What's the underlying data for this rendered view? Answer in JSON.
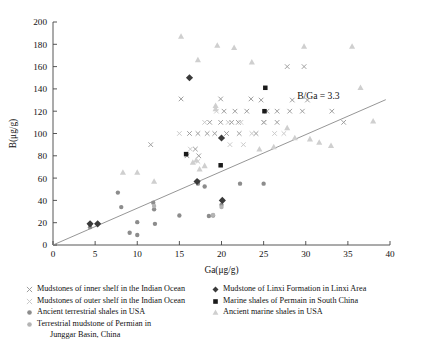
{
  "chart_data": {
    "type": "scatter",
    "title": "",
    "xlabel": "Ga(μg/g)",
    "ylabel": "B(μg/g)",
    "xlim": [
      0,
      40
    ],
    "ylim": [
      0,
      200
    ],
    "xticks": [
      0,
      5,
      10,
      15,
      20,
      25,
      30,
      35,
      40
    ],
    "yticks": [
      0,
      20,
      40,
      60,
      80,
      100,
      120,
      140,
      160,
      180,
      200
    ],
    "grid": false,
    "legend_position": "below-axes",
    "annotations": [
      {
        "text": "B/Ga = 3.3",
        "x": 31.5,
        "y": 131,
        "name": "ratio-line-label"
      }
    ],
    "reference_line": {
      "name": "b-ga-ratio-line",
      "label": "B/Ga = 3.3",
      "slope": 3.3,
      "intercept": 0,
      "x_from": 0,
      "x_to": 39.5,
      "color": "#8a8a8a"
    },
    "series": [
      {
        "name": "Mudstones of inner shelf in the Indian Ocean",
        "marker": "x",
        "color": "#9a9a9a",
        "points": [
          [
            11.6,
            90
          ],
          [
            15.2,
            131
          ],
          [
            16.9,
            86
          ],
          [
            15.9,
            80
          ],
          [
            17.3,
            80
          ],
          [
            19.9,
            131
          ],
          [
            22.0,
            110
          ],
          [
            22.1,
            100
          ],
          [
            23.5,
            131
          ],
          [
            24.7,
            130
          ],
          [
            20.3,
            120
          ],
          [
            21.6,
            120
          ],
          [
            23.0,
            120
          ],
          [
            25.4,
            120
          ],
          [
            26.6,
            120
          ],
          [
            18.6,
            110
          ],
          [
            19.9,
            110
          ],
          [
            21.2,
            110
          ],
          [
            19.2,
            100
          ],
          [
            20.6,
            100
          ],
          [
            18.3,
            100
          ],
          [
            17.2,
            100
          ],
          [
            16.2,
            100
          ],
          [
            27.8,
            160
          ],
          [
            29.8,
            160
          ],
          [
            28.4,
            130
          ],
          [
            30.2,
            130
          ],
          [
            28.1,
            120
          ],
          [
            29.6,
            120
          ],
          [
            33.1,
            120
          ],
          [
            34.5,
            110
          ],
          [
            26.6,
            110
          ],
          [
            25.0,
            110
          ],
          [
            24.1,
            100
          ]
        ]
      },
      {
        "name": "Mudstones of outer shelf in the Indian Ocean",
        "marker": "x-light",
        "color": "#c8c8c8",
        "points": [
          [
            15.0,
            100
          ],
          [
            16.3,
            86
          ],
          [
            17.2,
            75
          ],
          [
            18.0,
            110
          ],
          [
            19.4,
            120
          ],
          [
            20.8,
            110
          ],
          [
            22.3,
            110
          ],
          [
            23.6,
            100
          ],
          [
            25.1,
            110
          ],
          [
            26.3,
            100
          ],
          [
            27.4,
            100
          ],
          [
            21.0,
            90
          ],
          [
            22.6,
            90
          ]
        ]
      },
      {
        "name": "Ancient terrestrial shales in USA",
        "marker": "circle",
        "color": "#8c8c8c",
        "points": [
          [
            4.4,
            19
          ],
          [
            4.4,
            16
          ],
          [
            5.3,
            19
          ],
          [
            7.7,
            47
          ],
          [
            8.1,
            34
          ],
          [
            9.1,
            11
          ],
          [
            10.0,
            20.5
          ],
          [
            10.0,
            9
          ],
          [
            11.9,
            38
          ],
          [
            12.0,
            32
          ],
          [
            12.1,
            19
          ],
          [
            15.0,
            26.5
          ],
          [
            17.2,
            57
          ],
          [
            17.2,
            55
          ],
          [
            18.0,
            52.5
          ],
          [
            18.5,
            26
          ],
          [
            19.0,
            26.5
          ],
          [
            20.0,
            36
          ],
          [
            20.1,
            40
          ],
          [
            25.0,
            55
          ],
          [
            22.2,
            55
          ]
        ]
      },
      {
        "name": "Terrestrial mudstone of Permian in Junggar Basin, China",
        "marker": "circle-light",
        "color": "#b4b4b4",
        "points": [
          [
            12.0,
            35
          ],
          [
            19.0,
            27
          ],
          [
            20.0,
            34
          ]
        ]
      },
      {
        "name": "Mudstone of Linxi Formation in Linxi Area",
        "marker": "diamond",
        "color": "#3a3a3a",
        "points": [
          [
            16.2,
            150
          ],
          [
            20.0,
            96
          ],
          [
            17.1,
            57
          ],
          [
            20.1,
            40
          ],
          [
            4.4,
            19
          ],
          [
            5.3,
            19
          ]
        ]
      },
      {
        "name": "Marine shales of Permain in South China",
        "marker": "square",
        "color": "#1a1a1a",
        "points": [
          [
            25.2,
            141
          ],
          [
            25.1,
            120
          ],
          [
            15.8,
            81.5
          ],
          [
            19.9,
            71.5
          ]
        ]
      },
      {
        "name": "Ancient marine shales in USA",
        "marker": "triangle",
        "color": "#cfcfcf",
        "points": [
          [
            15.2,
            187
          ],
          [
            19.5,
            179
          ],
          [
            21.5,
            177
          ],
          [
            29.8,
            178
          ],
          [
            35.5,
            178
          ],
          [
            17.2,
            166
          ],
          [
            23.6,
            164
          ],
          [
            19.3,
            125
          ],
          [
            19.3,
            122
          ],
          [
            36.5,
            141
          ],
          [
            38.0,
            111
          ],
          [
            27.8,
            105
          ],
          [
            28.7,
            96
          ],
          [
            10.0,
            65
          ],
          [
            8.3,
            65
          ],
          [
            17.0,
            76
          ],
          [
            18.0,
            71
          ],
          [
            16.6,
            74
          ],
          [
            17.4,
            68
          ],
          [
            12.0,
            57
          ],
          [
            26.2,
            88
          ],
          [
            24.5,
            86
          ],
          [
            30.5,
            95
          ],
          [
            33.0,
            89
          ],
          [
            31.6,
            92
          ]
        ]
      }
    ]
  },
  "legend": {
    "left_column": [
      {
        "label": "Mudstones of inner shelf in the Indian Ocean",
        "marker": "x",
        "color": "#9a9a9a"
      },
      {
        "label": "Mudstones of outer shelf in the Indian Ocean",
        "marker": "x-light",
        "color": "#c8c8c8"
      },
      {
        "label": "Ancient terrestrial shales in USA",
        "marker": "circle",
        "color": "#8c8c8c"
      },
      {
        "label": "Terrestrial mudstone of Permian in",
        "label2": "Junggar Basin, China",
        "marker": "circle-light",
        "color": "#b4b4b4"
      }
    ],
    "right_column": [
      {
        "label": "Mudstone of Linxi Formation in Linxi Area",
        "marker": "diamond",
        "color": "#3a3a3a"
      },
      {
        "label": "Marine shales of Permain in South China",
        "marker": "square",
        "color": "#1a1a1a"
      },
      {
        "label": "Ancient marine shales in USA",
        "marker": "triangle",
        "color": "#cfcfcf"
      }
    ]
  }
}
